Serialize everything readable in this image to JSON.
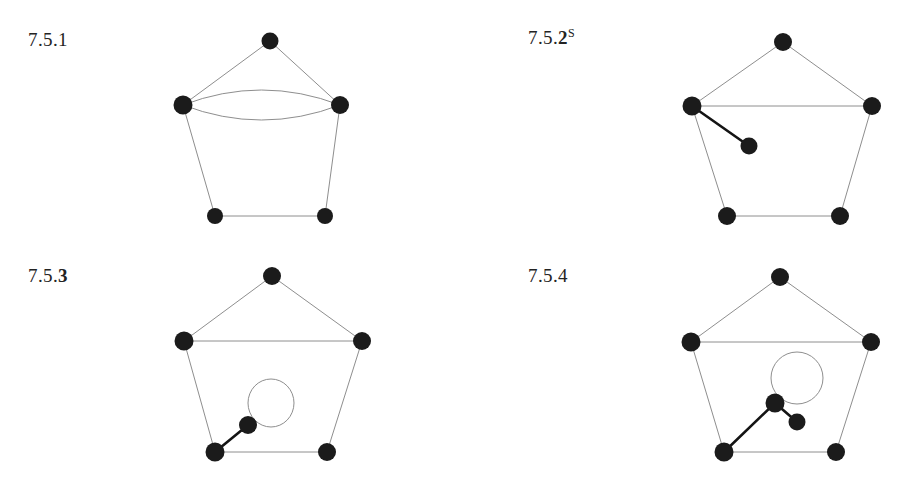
{
  "page": {
    "background_color": "#ffffff",
    "ink_color": "#1b1b1b",
    "thin_edge_color": "#8e8e8e",
    "thick_edge_color": "#141414",
    "width": 904,
    "height": 487
  },
  "figures": [
    {
      "id": "figure-7-5-1",
      "label": {
        "prefix": "7.5.",
        "number": "1",
        "number_bold": false,
        "superscript": ""
      },
      "caption_text": "7.5.1",
      "description": "Pentagon with a doubled (parallel) edge between the two middle vertices",
      "vertices": [
        {
          "name": "top",
          "cx": 270,
          "cy": 41,
          "r": 8.5
        },
        {
          "name": "mid-left",
          "cx": 183,
          "cy": 105,
          "r": 9.5
        },
        {
          "name": "mid-right",
          "cx": 340,
          "cy": 105,
          "r": 9.0
        },
        {
          "name": "bottom-left",
          "cx": 215,
          "cy": 216,
          "r": 8.0
        },
        {
          "name": "bottom-right",
          "cx": 325,
          "cy": 216,
          "r": 8.0
        }
      ],
      "edges": [
        {
          "from": "mid-left",
          "to": "top",
          "style": "thin",
          "kind": "straight"
        },
        {
          "from": "top",
          "to": "mid-right",
          "style": "thin",
          "kind": "straight"
        },
        {
          "from": "mid-right",
          "to": "bottom-right",
          "style": "thin",
          "kind": "straight"
        },
        {
          "from": "bottom-right",
          "to": "bottom-left",
          "style": "thin",
          "kind": "straight"
        },
        {
          "from": "bottom-left",
          "to": "mid-left",
          "style": "thin",
          "kind": "straight"
        },
        {
          "from": "mid-left",
          "to": "mid-right",
          "style": "thin",
          "kind": "arc-up"
        },
        {
          "from": "mid-left",
          "to": "mid-right",
          "style": "thin",
          "kind": "arc-down"
        }
      ],
      "loops": []
    },
    {
      "id": "figure-7-5-2",
      "label": {
        "prefix": "7.5.",
        "number": "2",
        "number_bold": true,
        "superscript": "S"
      },
      "caption_text": "7.5.2S",
      "description": "Pentagon with horizontal chord and a pendant vertex joined to the mid-left vertex",
      "vertices": [
        {
          "name": "top",
          "cx": 783,
          "cy": 42,
          "r": 9.0
        },
        {
          "name": "mid-left",
          "cx": 692,
          "cy": 106,
          "r": 9.5
        },
        {
          "name": "mid-right",
          "cx": 872,
          "cy": 106,
          "r": 9.0
        },
        {
          "name": "bottom-left",
          "cx": 727,
          "cy": 216,
          "r": 9.0
        },
        {
          "name": "bottom-right",
          "cx": 840,
          "cy": 216,
          "r": 9.0
        },
        {
          "name": "pendant",
          "cx": 749,
          "cy": 146,
          "r": 8.5
        }
      ],
      "edges": [
        {
          "from": "mid-left",
          "to": "top",
          "style": "thin",
          "kind": "straight"
        },
        {
          "from": "top",
          "to": "mid-right",
          "style": "thin",
          "kind": "straight"
        },
        {
          "from": "mid-right",
          "to": "bottom-right",
          "style": "thin",
          "kind": "straight"
        },
        {
          "from": "bottom-right",
          "to": "bottom-left",
          "style": "thin",
          "kind": "straight"
        },
        {
          "from": "bottom-left",
          "to": "mid-left",
          "style": "thin",
          "kind": "straight"
        },
        {
          "from": "mid-left",
          "to": "mid-right",
          "style": "thin",
          "kind": "straight"
        },
        {
          "from": "mid-left",
          "to": "pendant",
          "style": "thick",
          "kind": "straight"
        }
      ],
      "loops": []
    },
    {
      "id": "figure-7-5-3",
      "label": {
        "prefix": "7.5.",
        "number": "3",
        "number_bold": true,
        "superscript": ""
      },
      "caption_text": "7.5.3",
      "description": "Pentagon with horizontal chord, a pendant vertex on the bottom-left vertex, and a self-loop on that pendant vertex",
      "vertices": [
        {
          "name": "top",
          "cx": 272,
          "cy": 276,
          "r": 9.0
        },
        {
          "name": "mid-left",
          "cx": 184,
          "cy": 341,
          "r": 9.5
        },
        {
          "name": "mid-right",
          "cx": 362,
          "cy": 341,
          "r": 9.0
        },
        {
          "name": "bottom-left",
          "cx": 215,
          "cy": 452,
          "r": 9.5
        },
        {
          "name": "bottom-right",
          "cx": 327,
          "cy": 452,
          "r": 9.0
        },
        {
          "name": "pendant",
          "cx": 248,
          "cy": 425,
          "r": 9.0
        }
      ],
      "edges": [
        {
          "from": "mid-left",
          "to": "top",
          "style": "thin",
          "kind": "straight"
        },
        {
          "from": "top",
          "to": "mid-right",
          "style": "thin",
          "kind": "straight"
        },
        {
          "from": "mid-right",
          "to": "bottom-right",
          "style": "thin",
          "kind": "straight"
        },
        {
          "from": "bottom-right",
          "to": "bottom-left",
          "style": "thin",
          "kind": "straight"
        },
        {
          "from": "bottom-left",
          "to": "mid-left",
          "style": "thin",
          "kind": "straight"
        },
        {
          "from": "mid-left",
          "to": "mid-right",
          "style": "thin",
          "kind": "straight"
        },
        {
          "from": "bottom-left",
          "to": "pendant",
          "style": "thick",
          "kind": "straight"
        }
      ],
      "loops": [
        {
          "at": "pendant",
          "cx": 271,
          "cy": 403,
          "rx": 23,
          "ry": 24,
          "style": "thin"
        }
      ]
    },
    {
      "id": "figure-7-5-4",
      "label": {
        "prefix": "7.5.",
        "number": "4",
        "number_bold": false,
        "superscript": ""
      },
      "caption_text": "7.5.4",
      "description": "Pentagon with horizontal chord, a vertex on the bottom-left vertex carrying a self-loop, and a further pendant vertex",
      "vertices": [
        {
          "name": "top",
          "cx": 780,
          "cy": 277,
          "r": 9.0
        },
        {
          "name": "mid-left",
          "cx": 691,
          "cy": 342,
          "r": 9.5
        },
        {
          "name": "mid-right",
          "cx": 871,
          "cy": 342,
          "r": 9.0
        },
        {
          "name": "bottom-left",
          "cx": 724,
          "cy": 452,
          "r": 9.5
        },
        {
          "name": "bottom-right",
          "cx": 836,
          "cy": 452,
          "r": 9.0
        },
        {
          "name": "hub",
          "cx": 775,
          "cy": 403,
          "r": 9.5
        },
        {
          "name": "pendant",
          "cx": 797,
          "cy": 422,
          "r": 8.5
        }
      ],
      "edges": [
        {
          "from": "mid-left",
          "to": "top",
          "style": "thin",
          "kind": "straight"
        },
        {
          "from": "top",
          "to": "mid-right",
          "style": "thin",
          "kind": "straight"
        },
        {
          "from": "mid-right",
          "to": "bottom-right",
          "style": "thin",
          "kind": "straight"
        },
        {
          "from": "bottom-right",
          "to": "bottom-left",
          "style": "thin",
          "kind": "straight"
        },
        {
          "from": "bottom-left",
          "to": "mid-left",
          "style": "thin",
          "kind": "straight"
        },
        {
          "from": "mid-left",
          "to": "mid-right",
          "style": "thin",
          "kind": "straight"
        },
        {
          "from": "bottom-left",
          "to": "hub",
          "style": "thick",
          "kind": "straight"
        },
        {
          "from": "hub",
          "to": "pendant",
          "style": "thick",
          "kind": "straight"
        }
      ],
      "loops": [
        {
          "at": "hub",
          "cx": 797,
          "cy": 378,
          "rx": 26,
          "ry": 26,
          "style": "thin"
        }
      ]
    }
  ]
}
